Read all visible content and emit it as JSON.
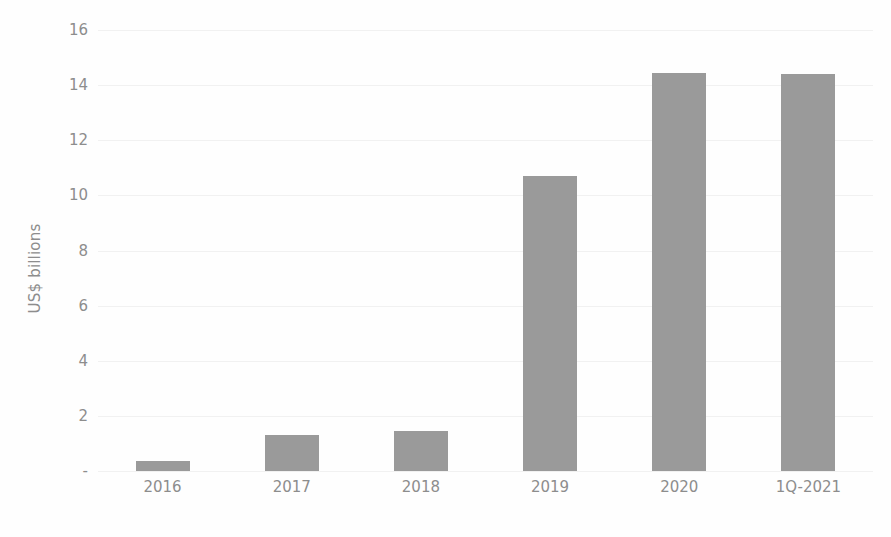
{
  "chart_data": {
    "type": "bar",
    "title": "",
    "subtitle": "",
    "xlabel": "",
    "ylabel": "US$ billions",
    "categories": [
      "2016",
      "2017",
      "2018",
      "2019",
      "2020",
      "1Q-2021"
    ],
    "values": [
      0.35,
      1.3,
      1.45,
      10.7,
      14.45,
      14.4
    ],
    "series": [
      {
        "name": "",
        "values": [
          0.35,
          1.3,
          1.45,
          10.7,
          14.45,
          14.4
        ]
      }
    ],
    "ylim": [
      0,
      16
    ],
    "y_tick_values": [
      0,
      2,
      4,
      6,
      8,
      10,
      12,
      14,
      16
    ],
    "y_tick_labels": [
      " - ",
      "2",
      "4",
      "6",
      "8",
      "10",
      "12",
      "14",
      "16"
    ],
    "grid": true,
    "grid_axis": "y",
    "legend": false,
    "legend_position": "none",
    "bar_color": "#9a9a9a",
    "grid_color": "#f1f1f1",
    "text_color": "#8d8d8d",
    "background_color": "#fefefe",
    "annotations": []
  }
}
